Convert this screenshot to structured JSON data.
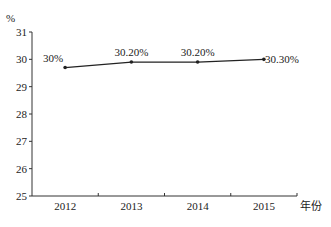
{
  "chart_data": {
    "type": "line",
    "title": "",
    "xlabel": "年份",
    "ylabel": "%",
    "categories": [
      "2012",
      "2013",
      "2014",
      "2015"
    ],
    "series": [
      {
        "name": "",
        "values": [
          29.7,
          29.9,
          29.9,
          30.0
        ],
        "labels": [
          "30%",
          "30.20%",
          "30.20%",
          "30.30%"
        ]
      }
    ],
    "yticks": [
      "25",
      "26",
      "27",
      "28",
      "29",
      "30",
      "31"
    ],
    "ylim": [
      25,
      31
    ],
    "grid": false,
    "legend": "none"
  }
}
